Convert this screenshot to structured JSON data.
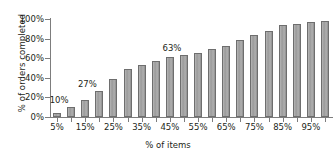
{
  "chart_data": {
    "type": "bar",
    "title": "",
    "xlabel": "% of items",
    "ylabel": "% of orders completed",
    "xlim": [
      0,
      100
    ],
    "ylim": [
      0,
      100
    ],
    "grid": false,
    "legend": null,
    "categories": [
      "5%",
      "10%",
      "15%",
      "20%",
      "25%",
      "30%",
      "35%",
      "40%",
      "45%",
      "50%",
      "55%",
      "60%",
      "65%",
      "70%",
      "75%",
      "80%",
      "85%",
      "90%",
      "95%",
      "100%"
    ],
    "values": [
      4,
      10,
      17,
      27,
      39,
      49,
      53,
      57,
      61,
      63,
      65,
      69,
      72,
      79,
      84,
      88,
      94,
      95,
      97,
      98
    ],
    "y_ticks": [
      "0%",
      "20%",
      "40%",
      "60%",
      "80%",
      "100%"
    ],
    "y_tick_values": [
      0,
      20,
      40,
      60,
      80,
      100
    ],
    "x_tick_labels": [
      "5%",
      "15%",
      "25%",
      "35%",
      "45%",
      "55%",
      "65%",
      "75%",
      "85%",
      "95%"
    ],
    "x_tick_label_indices": [
      0,
      2,
      4,
      6,
      8,
      10,
      12,
      14,
      16,
      18
    ],
    "annotations": [
      {
        "text": "10%",
        "bar_index": 1,
        "value": 10
      },
      {
        "text": "27%",
        "bar_index": 3,
        "value": 27
      },
      {
        "text": "63%",
        "bar_index": 9,
        "value": 63
      }
    ],
    "colors": {
      "bar_fill": "#a3a3a3",
      "bar_stroke": "#6e6e6e",
      "axis": "#7d7d7d",
      "text": "#231f20",
      "background": "#ffffff"
    }
  }
}
